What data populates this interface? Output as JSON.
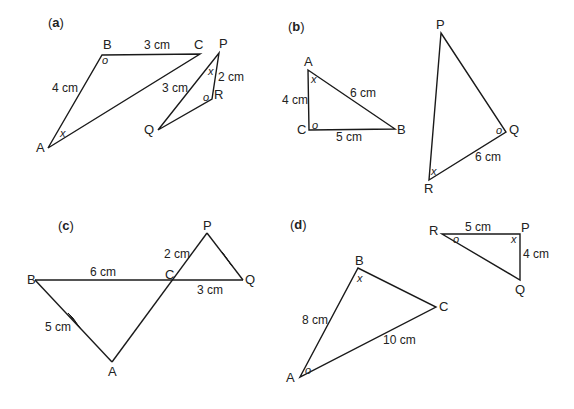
{
  "figures": {
    "a": {
      "part_label": "a",
      "points": {
        "A": "A",
        "B": "B",
        "C": "C",
        "P": "P",
        "Q": "Q",
        "R": "R"
      },
      "lengths": {
        "AB": "4 cm",
        "BC": "3 cm",
        "PQ": "3 cm",
        "PR": "2 cm"
      },
      "angles": {
        "B": "o",
        "A": "x",
        "P": "x",
        "R": "o"
      }
    },
    "b": {
      "part_label": "b",
      "points": {
        "A": "A",
        "B": "B",
        "C": "C",
        "P": "P",
        "Q": "Q",
        "R": "R"
      },
      "lengths": {
        "AC": "4 cm",
        "AB": "6 cm",
        "CB": "5 cm",
        "QR": "6 cm"
      },
      "angles": {
        "A": "x",
        "C": "o",
        "Q": "o",
        "R": "x"
      }
    },
    "c": {
      "part_label": "c",
      "points": {
        "A": "A",
        "B": "B",
        "C": "C",
        "P": "P",
        "Q": "Q"
      },
      "lengths": {
        "BC": "6 cm",
        "CQ": "3 cm",
        "PC": "2 cm",
        "BA": "5 cm"
      }
    },
    "d": {
      "part_label": "d",
      "points": {
        "A": "A",
        "B": "B",
        "C": "C",
        "P": "P",
        "Q": "Q",
        "R": "R"
      },
      "lengths": {
        "AB": "8 cm",
        "AC": "10 cm",
        "RP": "5 cm",
        "PQ": "4 cm"
      },
      "angles": {
        "B": "x",
        "A": "o",
        "R": "o",
        "P": "x"
      }
    }
  }
}
